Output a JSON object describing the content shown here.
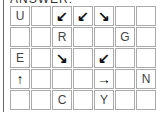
{
  "heading": "ANSWER:",
  "grid": {
    "rows": 5,
    "cols": 7,
    "cells": [
      [
        "U",
        "",
        "↙",
        "↙",
        "↘",
        "",
        ""
      ],
      [
        "",
        "",
        "R",
        "",
        "",
        "G",
        ""
      ],
      [
        "E",
        "",
        "↘",
        "",
        "↙",
        "",
        ""
      ],
      [
        "↑",
        "",
        "",
        "",
        "→",
        "",
        "N"
      ],
      [
        "",
        "",
        "C",
        "",
        "Y",
        "",
        ""
      ]
    ]
  }
}
